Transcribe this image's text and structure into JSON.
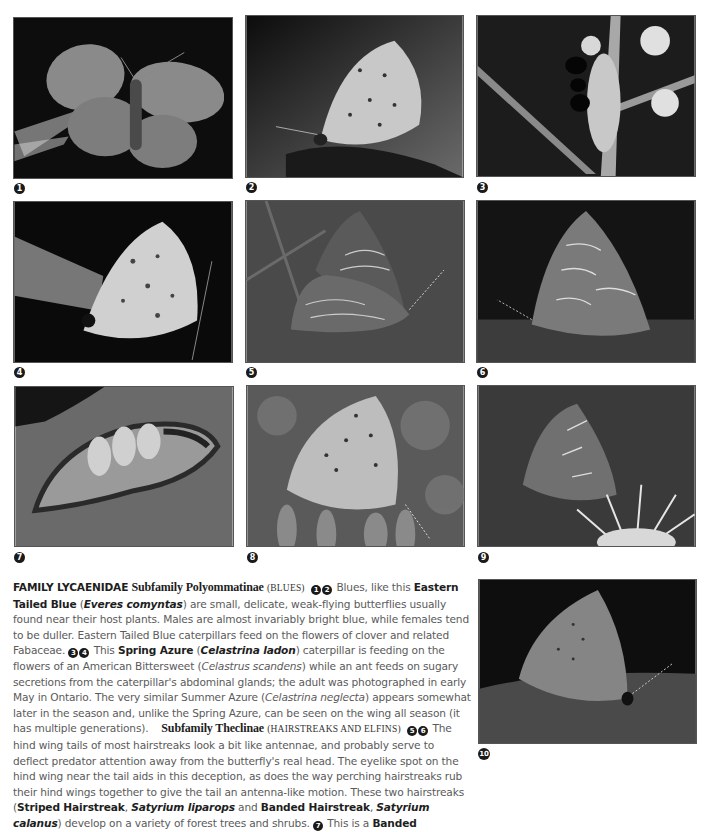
{
  "photos": [
    {
      "num": "1",
      "subject": "Eastern Tailed Blue, open wings",
      "bg": "#0d0d0d",
      "wing": "#8a8a8a"
    },
    {
      "num": "2",
      "subject": "Eastern Tailed Blue, side view",
      "bg": "#2a2a2a",
      "wing": "#c8c8c8"
    },
    {
      "num": "3",
      "subject": "Spring Azure caterpillar with ant",
      "bg": "#1c1c1c",
      "wing": "#bbbbbb"
    },
    {
      "num": "4",
      "subject": "Spring Azure adult",
      "bg": "#0a0a0a",
      "wing": "#d0d0d0"
    },
    {
      "num": "5",
      "subject": "Striped Hairstreak",
      "bg": "#4a4a4a",
      "wing": "#6e6e6e"
    },
    {
      "num": "6",
      "subject": "Banded Hairstreak",
      "bg": "#141414",
      "wing": "#7a7a7a"
    },
    {
      "num": "7",
      "subject": "Banded Hairstreak caterpillar",
      "bg": "#6a6a6a",
      "wing": "#9a9a9a"
    },
    {
      "num": "8",
      "subject": "Blue butterfly on flowers",
      "bg": "#5a5a5a",
      "wing": "#bdbdbd"
    },
    {
      "num": "9",
      "subject": "Hairstreak on flower",
      "bg": "#3a3a3a",
      "wing": "#707070"
    },
    {
      "num": "10",
      "subject": "Hairstreak on leaf",
      "bg": "#0e0e0e",
      "wing": "#858585"
    }
  ],
  "caption": {
    "family": "FAMILY LYCAENIDAE",
    "subfamily1": "Subfamily Polyommatinae",
    "subfamily1_common": "(BLUES)",
    "refs_1_2": [
      "1",
      "2"
    ],
    "p1_a": " Blues, like this ",
    "eastern_tailed_blue": "Eastern Tailed Blue",
    "p1_b": " (",
    "everes": "Everes comyntas",
    "p1_c": ") are small, delicate, weak-flying butterflies usually found near their host plants. Males are almost invariably bright blue, while females tend to be duller. Eastern Tailed Blue caterpillars feed on the flowers of clover and related Fabaceae. ",
    "refs_3_4": [
      "3",
      "4"
    ],
    "p2_a": " This ",
    "spring_azure": "Spring Azure",
    "p2_b": " (",
    "celastrina_ladon": "Celastrina ladon",
    "p2_c": ") caterpillar is feeding on the flowers of an American Bittersweet (",
    "celastrus": "Celastrus scandens",
    "p2_d": ") while an ant feeds on sugary secretions from the caterpillar's abdominal glands; the adult was photographed in early May in Ontario. The very similar Summer Azure (",
    "celastrina_neglecta": "Celastrina neglecta",
    "p2_e": ") appears somewhat later in the season and, unlike the Spring Azure, can be seen on the wing all season (it has multiple generations).",
    "subfamily2": "Subfamily Theclinae",
    "subfamily2_common": "(HAIRSTREAKS AND ELFINS)",
    "refs_5_6": [
      "5",
      "6"
    ],
    "p3_a": " The hind wing tails of most hairstreaks look a bit like antennae, and probably serve to deflect predator attention away from the butterfly's real head. The eyelike spot on the hind wing near the tail aids in this deception, as does the way perching hairstreaks rub their hind wings together to give the tail an antenna-like motion. These two hairstreaks (",
    "striped_hairstreak": "Striped Hairstreak",
    "p3_b": ", ",
    "satyrium_liparops": "Satyrium liparops",
    "p3_c": " and ",
    "banded_hairstreak": "Banded Hairstreak",
    "p3_d": ", ",
    "satyrium_calanus": "Satyrium calanus",
    "p3_e": ") develop on a variety of forest trees and shrubs. ",
    "ref_7": "7",
    "p4_a": " This is a ",
    "banded": "Banded"
  }
}
